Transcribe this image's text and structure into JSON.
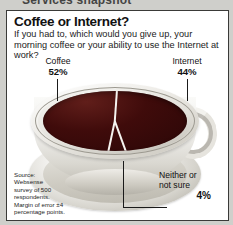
{
  "page": {
    "clipped_headline": "Services snapshot",
    "background_color": "#cfcfcb",
    "panel_background": "#ffffff",
    "border_color": "#3a3a38"
  },
  "chart_data": {
    "type": "pie",
    "title": "Coffee or Internet?",
    "subtitle": "If you had to, which would you give up, your morning coffee or your ability to use the Internet at work?",
    "categories": [
      "Coffee",
      "Internet",
      "Neither or not sure"
    ],
    "values": [
      52,
      44,
      4
    ],
    "value_labels": [
      "52%",
      "44%",
      "4%"
    ],
    "unit": "%",
    "xlabel": "",
    "ylabel": "",
    "legend": "labels-with-leader-lines",
    "grid": false,
    "slice_color": "#3d0a0a",
    "separator_color": "#f5f3ef",
    "illustration": "coffee-cup-viewed-from-above",
    "source": "Source: Websense survey of 500 respondents. Margin of error ±4 percentage points."
  },
  "labels": {
    "coffee": {
      "name": "Coffee",
      "pct": "52%"
    },
    "internet": {
      "name": "Internet",
      "pct": "44%"
    },
    "neither": {
      "name_line1": "Neither or",
      "name_line2": "not sure",
      "pct": "4%"
    }
  },
  "source": {
    "line1": "Source:",
    "line2": "Websense",
    "line3": "survey of 500",
    "line4": "respondents.",
    "line5": "Margin of error ±4",
    "line6": "percentage points."
  }
}
